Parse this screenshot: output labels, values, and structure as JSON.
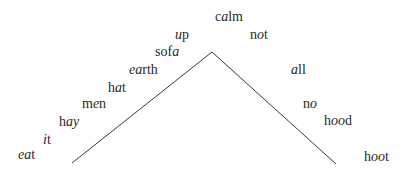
{
  "diagram": {
    "type": "vowel-chart",
    "line_color": "#3a3a3a",
    "text_color": "#2a2a2a",
    "shape": {
      "apex": [
        212,
        52
      ],
      "left_foot": [
        72,
        163
      ],
      "right_foot": [
        336,
        164
      ]
    },
    "words": [
      {
        "id": "calm",
        "parts": [
          {
            "t": "c",
            "i": false
          },
          {
            "t": "a",
            "i": true
          },
          {
            "t": "lm",
            "i": false
          }
        ],
        "x": 215,
        "y": 10
      },
      {
        "id": "up",
        "parts": [
          {
            "t": "u",
            "i": true
          },
          {
            "t": "p",
            "i": false
          }
        ],
        "x": 175,
        "y": 28
      },
      {
        "id": "not",
        "parts": [
          {
            "t": "n",
            "i": false
          },
          {
            "t": "o",
            "i": true
          },
          {
            "t": "t",
            "i": false
          }
        ],
        "x": 250,
        "y": 28
      },
      {
        "id": "sofa",
        "parts": [
          {
            "t": "sof",
            "i": false
          },
          {
            "t": "a",
            "i": true
          }
        ],
        "x": 155,
        "y": 45
      },
      {
        "id": "earth",
        "parts": [
          {
            "t": "ea",
            "i": true
          },
          {
            "t": "rth",
            "i": false
          }
        ],
        "x": 129,
        "y": 63
      },
      {
        "id": "all",
        "parts": [
          {
            "t": "a",
            "i": true
          },
          {
            "t": "ll",
            "i": false
          }
        ],
        "x": 291,
        "y": 63
      },
      {
        "id": "hat",
        "parts": [
          {
            "t": "h",
            "i": false
          },
          {
            "t": "a",
            "i": true
          },
          {
            "t": "t",
            "i": false
          }
        ],
        "x": 108,
        "y": 81
      },
      {
        "id": "men",
        "parts": [
          {
            "t": "m",
            "i": false
          },
          {
            "t": "e",
            "i": true
          },
          {
            "t": "n",
            "i": false
          }
        ],
        "x": 82,
        "y": 97
      },
      {
        "id": "no",
        "parts": [
          {
            "t": "n",
            "i": false
          },
          {
            "t": "o",
            "i": true
          }
        ],
        "x": 303,
        "y": 97
      },
      {
        "id": "hood",
        "parts": [
          {
            "t": "h",
            "i": false
          },
          {
            "t": "oo",
            "i": true
          },
          {
            "t": "d",
            "i": false
          }
        ],
        "x": 324,
        "y": 114
      },
      {
        "id": "hay",
        "parts": [
          {
            "t": "h",
            "i": false
          },
          {
            "t": "ay",
            "i": true
          }
        ],
        "x": 59,
        "y": 115
      },
      {
        "id": "it",
        "parts": [
          {
            "t": "i",
            "i": true
          },
          {
            "t": "t",
            "i": false
          }
        ],
        "x": 43,
        "y": 133
      },
      {
        "id": "eat",
        "parts": [
          {
            "t": "ea",
            "i": true
          },
          {
            "t": "t",
            "i": false
          }
        ],
        "x": 18,
        "y": 148
      },
      {
        "id": "hoot",
        "parts": [
          {
            "t": "h",
            "i": false
          },
          {
            "t": "oo",
            "i": true
          },
          {
            "t": "t",
            "i": false
          }
        ],
        "x": 364,
        "y": 150
      }
    ]
  }
}
